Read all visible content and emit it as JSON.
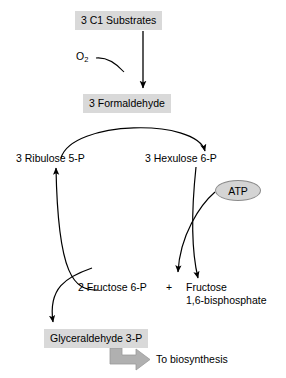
{
  "diagram": {
    "type": "metabolic-pathway-flowchart",
    "background_color": "#ffffff",
    "box_fill_color": "#d9d9d9",
    "ellipse_fill_color": "#d4d4d4",
    "block_arrow_color": "#b0b0b0",
    "line_color": "#000000",
    "nodes": {
      "c1_substrates": "3 C1 Substrates",
      "oxygen": "O",
      "oxygen_subscript": "2",
      "formaldehyde": "3 Formaldehyde",
      "ribulose_5p": "3 Ribulose 5-P",
      "hexulose_6p": "3 Hexulose 6-P",
      "atp": "ATP",
      "fructose_6p": "2 Fructose 6-P",
      "plus_sign": "+",
      "fructose_bisphosphate_line1": "Fructose",
      "fructose_bisphosphate_line2": "1,6-bisphosphate",
      "glyceraldehyde_3p": "Glyceraldehyde 3-P",
      "to_biosynthesis": "To biosynthesis"
    }
  }
}
